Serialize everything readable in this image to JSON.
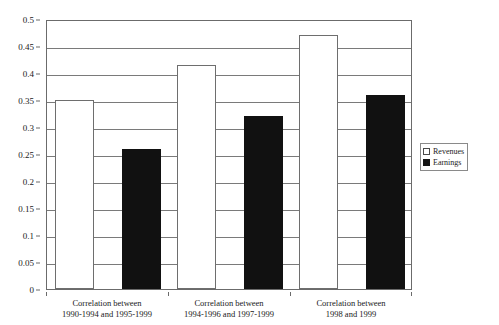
{
  "chart_data": {
    "type": "bar",
    "title": "",
    "subtitle": "",
    "xlabel": "",
    "ylabel": "",
    "ylim": [
      0,
      0.5
    ],
    "ytick_step": 0.05,
    "grid": true,
    "legend_position": "right",
    "categories": [
      "Correlation between 1990-1994 and 1995-1999",
      "Correlation between 1994-1996 and 1997-1999",
      "Correlation between 1998 and 1999"
    ],
    "category_lines": [
      [
        "Correlation between",
        "1990-1994 and 1995-1999"
      ],
      [
        "Correlation between",
        "1994-1996 and 1997-1999"
      ],
      [
        "Correlation between",
        "1998 and 1999"
      ]
    ],
    "series": [
      {
        "name": "Revenues",
        "color": "#ffffff",
        "values": [
          0.35,
          0.415,
          0.47
        ]
      },
      {
        "name": "Earnings",
        "color": "#111111",
        "values": [
          0.26,
          0.32,
          0.36
        ]
      }
    ],
    "ytick_labels": [
      "0.5",
      "0.45",
      "0.4",
      "0.35",
      "0.3",
      "0.25",
      "0.2",
      "0.15",
      "0.1",
      "0.05",
      "0"
    ],
    "ytick_values": [
      0.5,
      0.45,
      0.4,
      0.35,
      0.3,
      0.25,
      0.2,
      0.15,
      0.1,
      0.05,
      0
    ]
  },
  "legend": {
    "items": [
      {
        "label": "Revenues",
        "swatch": "revenues"
      },
      {
        "label": "Earnings",
        "swatch": "earnings"
      }
    ]
  }
}
